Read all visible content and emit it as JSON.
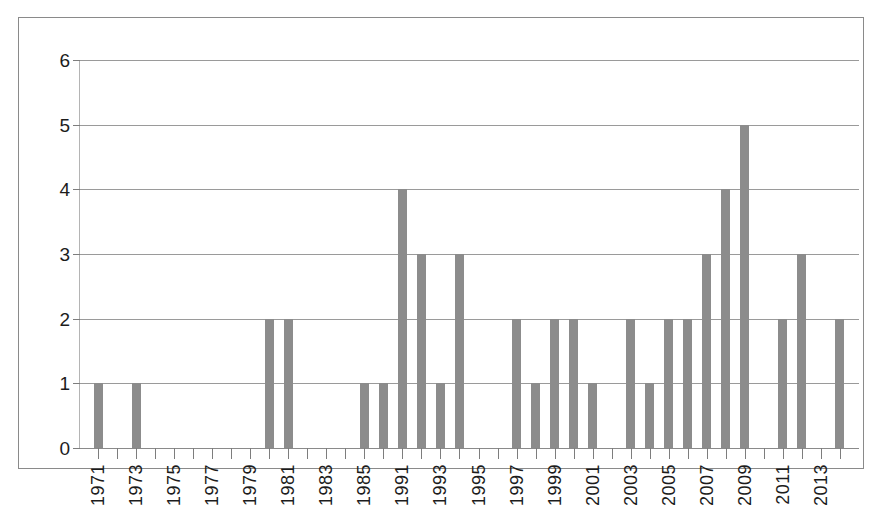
{
  "chart_data": {
    "type": "bar",
    "title": "",
    "subtitle": "",
    "xlabel": "",
    "ylabel": "",
    "ylim": [
      0,
      6
    ],
    "yticks": [
      0,
      1,
      2,
      3,
      4,
      5,
      6
    ],
    "ytick_labels": [
      "0",
      "1",
      "2",
      "3",
      "4",
      "5",
      "6"
    ],
    "grid": true,
    "legend": false,
    "bar_color": "#8c8c8c",
    "grid_color": "#9a9a9a",
    "axis_color": "#8a8a8a",
    "frame_color": "#8a8a8a",
    "categories": [
      "1971",
      "1972",
      "1973",
      "1974",
      "1975",
      "1976",
      "1977",
      "1978",
      "1979",
      "1980",
      "1981",
      "1982",
      "1983",
      "1984",
      "1985",
      "1986",
      "1991",
      "1992",
      "1993",
      "1994",
      "1995",
      "1996",
      "1997",
      "1998",
      "1999",
      "2000",
      "2001",
      "2002",
      "2003",
      "2004",
      "2005",
      "2006",
      "2007",
      "2008",
      "2009",
      "2010",
      "2011",
      "2012",
      "2013",
      "2014"
    ],
    "values": [
      1,
      0,
      1,
      0,
      0,
      0,
      0,
      0,
      0,
      2,
      2,
      0,
      0,
      0,
      1,
      1,
      4,
      3,
      1,
      3,
      0,
      0,
      2,
      1,
      2,
      2,
      1,
      0,
      2,
      1,
      2,
      2,
      3,
      4,
      5,
      0,
      2,
      3,
      0,
      2
    ],
    "xtick_labels": [
      "1971",
      "1973",
      "1975",
      "1977",
      "1979",
      "1981",
      "1983",
      "1985",
      "1991",
      "1993",
      "1995",
      "1997",
      "1999",
      "2001",
      "2003",
      "2005",
      "2007",
      "2009",
      "2011",
      "2013"
    ],
    "xtick_label_indices": [
      0,
      2,
      4,
      6,
      8,
      10,
      12,
      14,
      16,
      18,
      20,
      22,
      24,
      26,
      28,
      30,
      32,
      34,
      36,
      38
    ]
  }
}
